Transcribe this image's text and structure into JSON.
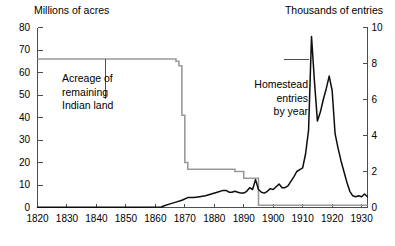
{
  "chart_data": {
    "type": "line",
    "title": "",
    "xlabel": "",
    "ylabel": "Millions of acres",
    "ylabel_right": "Thousands of entries",
    "xlim": [
      1820,
      1932
    ],
    "ylim": [
      0,
      80
    ],
    "ylim_right": [
      0,
      10
    ],
    "grid": false,
    "legend": "none",
    "x_ticks": [
      1820,
      1830,
      1840,
      1850,
      1860,
      1870,
      1880,
      1890,
      1900,
      1910,
      1920,
      1930
    ],
    "x_tick_labels": [
      "1820",
      "1830",
      "1840",
      "1850",
      "1860",
      "1870",
      "1880",
      "1890",
      "1900",
      "1910",
      "1920",
      "1930"
    ],
    "y_ticks_left": [
      0,
      10,
      20,
      30,
      40,
      50,
      60,
      70,
      80
    ],
    "y_tick_labels_left": [
      "0",
      "10",
      "20",
      "30",
      "40",
      "50",
      "60",
      "70",
      "80"
    ],
    "y_ticks_right": [
      0,
      2,
      4,
      6,
      8,
      10
    ],
    "y_tick_labels_right": [
      "0",
      "2",
      "4",
      "6",
      "8",
      "10"
    ],
    "annotations": [
      {
        "name": "acreage-annotation",
        "text": "Acreage of\nremaining\nIndian land",
        "line1": "Acreage of",
        "line2": "remaining",
        "line3": "Indian land",
        "points_to_year": 1843,
        "points_to_value": 66
      },
      {
        "name": "homestead-annotation",
        "text": "Homestead\nentries\nby year",
        "line1": "Homestead",
        "line2": "entries",
        "line3": "by year",
        "points_to_year": 1913,
        "points_to_value": 8.2
      }
    ],
    "series": [
      {
        "name": "Acreage of remaining Indian land",
        "axis": "left",
        "units": "millions of acres",
        "color": "#9a9a9a",
        "style": "step",
        "x": [
          1820,
          1866,
          1867,
          1868,
          1869,
          1870,
          1871,
          1872,
          1880,
          1887,
          1889,
          1890,
          1891,
          1894,
          1895,
          1900,
          1910,
          1920,
          1932
        ],
        "y": [
          66,
          66,
          65,
          63,
          41,
          20,
          17,
          17,
          17,
          16,
          16,
          13,
          13,
          13,
          1,
          1,
          1,
          1,
          1
        ]
      },
      {
        "name": "Homestead entries by year",
        "axis": "right",
        "units": "thousands of entries",
        "color": "#0d0d0d",
        "style": "line",
        "x": [
          1820,
          1840,
          1855,
          1862,
          1863,
          1865,
          1867,
          1869,
          1871,
          1873,
          1875,
          1877,
          1879,
          1881,
          1883,
          1884,
          1885,
          1886,
          1887,
          1888,
          1889,
          1890,
          1891,
          1892,
          1893,
          1894,
          1895,
          1896,
          1897,
          1898,
          1899,
          1900,
          1901,
          1902,
          1903,
          1904,
          1905,
          1906,
          1907,
          1908,
          1909,
          1910,
          1911,
          1912,
          1913,
          1914,
          1915,
          1916,
          1917,
          1918,
          1919,
          1920,
          1921,
          1922,
          1923,
          1924,
          1925,
          1926,
          1927,
          1928,
          1929,
          1930,
          1931,
          1932
        ],
        "y": [
          0.02,
          0.02,
          0.02,
          0.03,
          0.1,
          0.2,
          0.3,
          0.4,
          0.55,
          0.55,
          0.6,
          0.65,
          0.75,
          0.85,
          0.95,
          0.95,
          0.85,
          0.85,
          0.9,
          0.85,
          0.8,
          0.8,
          0.9,
          1.1,
          1.0,
          1.55,
          1.0,
          0.85,
          0.8,
          0.9,
          1.05,
          1.0,
          1.15,
          1.3,
          1.1,
          1.1,
          1.2,
          1.45,
          1.7,
          2.0,
          2.1,
          2.2,
          3.0,
          4.3,
          9.5,
          7.0,
          4.8,
          5.3,
          6.0,
          6.6,
          7.3,
          6.5,
          4.1,
          3.3,
          2.6,
          2.0,
          1.4,
          0.9,
          0.65,
          0.6,
          0.65,
          0.6,
          0.75,
          0.6
        ]
      }
    ]
  }
}
